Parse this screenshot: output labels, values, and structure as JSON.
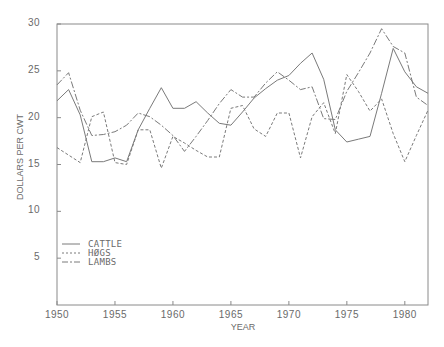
{
  "chart_data": {
    "type": "line",
    "title": "",
    "xlabel": "YEAR",
    "ylabel": "DOLLARS PER CWT",
    "xlim": [
      1950,
      1982
    ],
    "ylim": [
      0,
      30
    ],
    "x_ticks": [
      1950,
      1955,
      1960,
      1965,
      1970,
      1975,
      1980
    ],
    "y_ticks": [
      5,
      10,
      15,
      20,
      25,
      30
    ],
    "grid": false,
    "legend_position": "lower-left inside",
    "x": [
      1950,
      1951,
      1952,
      1953,
      1954,
      1955,
      1956,
      1957,
      1958,
      1959,
      1960,
      1961,
      1962,
      1963,
      1964,
      1965,
      1966,
      1967,
      1968,
      1969,
      1970,
      1971,
      1972,
      1973,
      1974,
      1975,
      1976,
      1977,
      1978,
      1979,
      1980,
      1981,
      1982
    ],
    "series": [
      {
        "name": "CATTLE",
        "style": "solid",
        "values": [
          21.8,
          23.0,
          20.3,
          15.3,
          15.3,
          15.7,
          15.3,
          18.7,
          21.0,
          23.2,
          21.0,
          21.0,
          21.7,
          20.5,
          19.4,
          19.2,
          20.6,
          22.1,
          23.1,
          24.0,
          24.5,
          25.8,
          26.9,
          24.1,
          18.7,
          17.4,
          17.7,
          18.0,
          22.6,
          27.4,
          24.9,
          23.3,
          22.6
        ]
      },
      {
        "name": "HØGS",
        "style": "dashed",
        "values": [
          16.8,
          16.0,
          15.2,
          20.1,
          20.6,
          15.2,
          15.0,
          18.7,
          18.7,
          14.6,
          18.0,
          17.3,
          16.5,
          15.8,
          15.8,
          21.0,
          21.3,
          18.8,
          18.0,
          20.5,
          20.5,
          15.7,
          20.1,
          21.6,
          18.3,
          24.6,
          22.8,
          20.7,
          22.0,
          18.3,
          15.3,
          18.1,
          20.8
        ]
      },
      {
        "name": "LAMBS",
        "style": "dash-dot",
        "values": [
          23.5,
          24.8,
          20.8,
          18.1,
          18.2,
          18.5,
          19.2,
          20.5,
          20.1,
          19.2,
          18.1,
          16.4,
          18.0,
          19.7,
          21.5,
          23.0,
          22.2,
          22.2,
          23.7,
          24.9,
          24.0,
          23.0,
          23.3,
          19.9,
          19.8,
          22.8,
          24.8,
          26.9,
          29.5,
          27.6,
          26.9,
          22.2,
          21.3
        ]
      }
    ]
  },
  "colors": {
    "axis": "#8a8a8a",
    "line": "#7a7a7a",
    "text": "#6a6a6a"
  },
  "labels": {
    "y_ticks": [
      "5",
      "10",
      "15",
      "20",
      "25",
      "30"
    ],
    "x_ticks": [
      "1950",
      "1955",
      "1960",
      "1965",
      "1970",
      "1975",
      "1980"
    ],
    "xlabel": "YEAR",
    "ylabel": "DOLLARS PER CWT"
  },
  "legend": {
    "items": [
      {
        "label": "CATTLE",
        "style": "solid"
      },
      {
        "label": "HØGS",
        "style": "dashed"
      },
      {
        "label": "LAMBS",
        "style": "dash-dot"
      }
    ]
  }
}
